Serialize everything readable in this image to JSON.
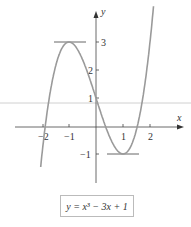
{
  "chart_data": {
    "type": "line",
    "title": "",
    "function": "y = x^3 - 3x + 1",
    "xlabel": "x",
    "ylabel": "y",
    "xlim": [
      -2.05,
      2.45
    ],
    "ylim": [
      -1.85,
      4.0
    ],
    "x_ticks": [
      -2,
      -1,
      1,
      2
    ],
    "x_tick_labels": [
      "-2",
      "-1",
      "1",
      "2"
    ],
    "y_ticks": [
      -1,
      1,
      2,
      3
    ],
    "y_tick_labels": [
      "-1",
      "1",
      "2",
      "3"
    ],
    "grid": false,
    "legend": null,
    "annotations": [
      {
        "type": "horizontal-tangent",
        "at": [
          -1,
          3
        ],
        "label": "local maximum"
      },
      {
        "type": "horizontal-tangent",
        "at": [
          1,
          -1
        ],
        "label": "local minimum"
      }
    ],
    "series": [
      {
        "name": "y = x^3 - 3x + 1",
        "x": [
          -2.05,
          -2.0,
          -1.75,
          -1.5,
          -1.25,
          -1.0,
          -0.75,
          -0.5,
          -0.25,
          0.0,
          0.25,
          0.5,
          0.75,
          1.0,
          1.25,
          1.5,
          1.75,
          2.0,
          2.25,
          2.4
        ],
        "y": [
          -1.47,
          -1.0,
          0.89,
          2.13,
          2.8,
          3.0,
          2.83,
          2.38,
          1.73,
          1.0,
          0.27,
          -0.38,
          -0.83,
          -1.0,
          -0.8,
          -0.13,
          1.11,
          3.0,
          5.64,
          7.62
        ]
      }
    ]
  },
  "labels": {
    "x_axis": "x",
    "y_axis": "y",
    "tick_neg2": "−2",
    "tick_neg1": "−1",
    "tick_1x": "1",
    "tick_2x": "2",
    "tick_3y": "3",
    "tick_2y": "2",
    "tick_1y": "1",
    "tick_neg1y": "−1"
  },
  "formula": {
    "text": "y = x³ − 3x + 1"
  },
  "colors": {
    "curve": "#999999",
    "axis": "#444444",
    "tangent": "#666666",
    "artifact_line": "#cccccc"
  }
}
